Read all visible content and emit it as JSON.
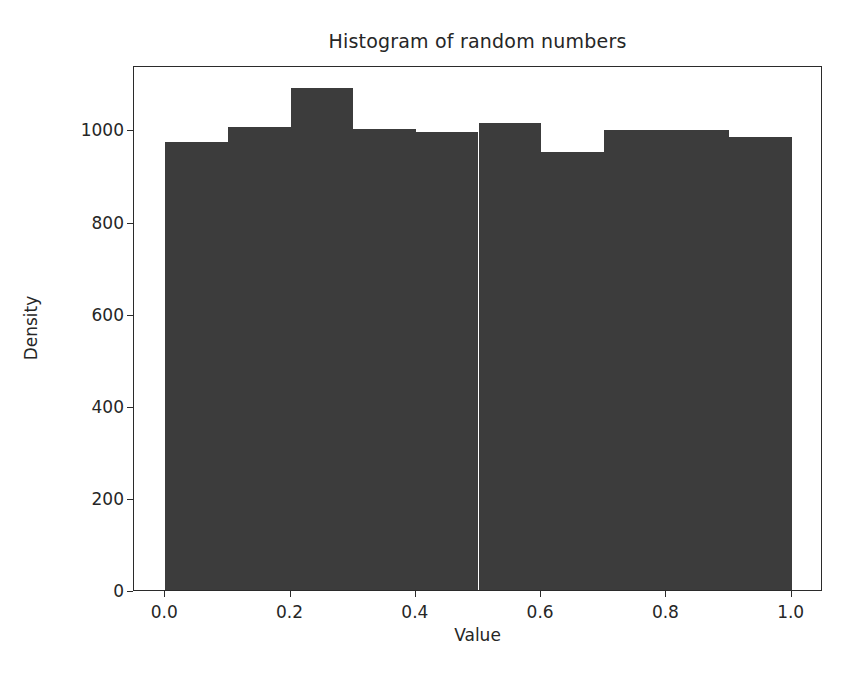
{
  "chart_data": {
    "type": "bar",
    "title": "Histogram of random numbers",
    "xlabel": "Value",
    "ylabel": "Density",
    "categories": [
      "0.0-0.1",
      "0.1-0.2",
      "0.2-0.3",
      "0.3-0.4",
      "0.4-0.5",
      "0.5-0.6",
      "0.6-0.7",
      "0.7-0.8",
      "0.8-0.9",
      "0.9-1.0"
    ],
    "bin_edges": [
      0.0,
      0.1,
      0.2,
      0.3,
      0.4,
      0.5,
      0.6,
      0.7,
      0.8,
      0.9,
      1.0
    ],
    "values": [
      972,
      1006,
      1091,
      1000,
      995,
      1015,
      952,
      998,
      998,
      983
    ],
    "bin_count": 10,
    "xlim": [
      -0.05,
      1.05
    ],
    "ylim": [
      0,
      1140
    ],
    "xticks": [
      "0.0",
      "0.2",
      "0.4",
      "0.6",
      "0.8",
      "1.0"
    ],
    "xtick_values": [
      0.0,
      0.2,
      0.4,
      0.6,
      0.8,
      1.0
    ],
    "yticks": [
      "0",
      "200",
      "400",
      "600",
      "800",
      "1000"
    ],
    "ytick_values": [
      0,
      200,
      400,
      600,
      800,
      1000
    ],
    "grid": false,
    "legend": false,
    "bar_color": "#3c3c3c",
    "axis_color": "#2b2b2b",
    "background": "#ffffff"
  }
}
